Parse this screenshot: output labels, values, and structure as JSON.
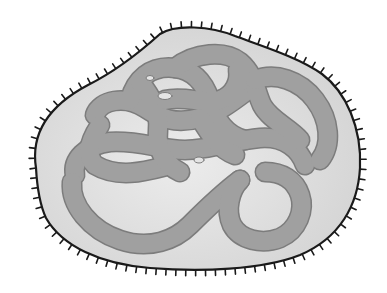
{
  "diagram": {
    "labels": [],
    "parts": [
      {
        "name": "cell-membrane",
        "description": "outer boundary with short hair-like projections"
      },
      {
        "name": "cytoplasm",
        "description": "light grey interior"
      },
      {
        "name": "nucleoid-dna",
        "description": "tangled looped grey band"
      }
    ],
    "colors": {
      "background": "#ffffff",
      "cytoplasm": "#dcdcdc",
      "cytoplasm_highlight": "#ebebeb",
      "dna": "#9e9e9e",
      "dna_edge": "#7a7a7a",
      "membrane": "#1a1a1a",
      "holes": "#e6e6e6"
    }
  }
}
